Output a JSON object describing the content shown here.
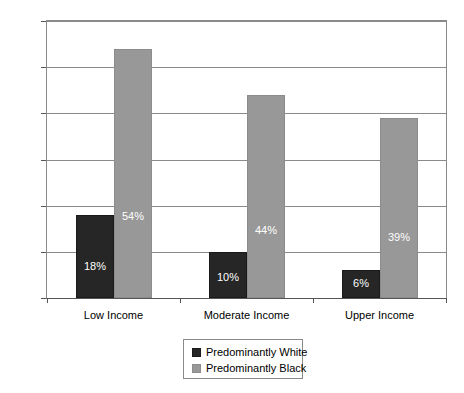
{
  "chart_data": {
    "type": "bar",
    "title": "",
    "subtitle": "",
    "xlabel": "",
    "ylabel": "",
    "categories": [
      "Low Income",
      "Moderate Income",
      "Upper Income"
    ],
    "series": [
      {
        "name": "Predominantly White",
        "color": "#262626",
        "values": [
          18,
          10,
          6
        ],
        "labels": [
          "18%",
          "10%",
          "6%"
        ]
      },
      {
        "name": "Predominantly Black",
        "color": "#989898",
        "values": [
          54,
          44,
          39
        ],
        "labels": [
          "54%",
          "44%",
          "39%"
        ]
      }
    ],
    "ylim": [
      0,
      60
    ],
    "yticks": [
      0,
      10,
      20,
      30,
      40,
      50,
      60
    ],
    "ytick_labels": [
      "0%",
      "10%",
      "20%",
      "30%",
      "40%",
      "50%",
      "60%"
    ],
    "grid": true,
    "grid_axis": "y",
    "legend_position": "bottom-center",
    "value_labels_inside_bars": true,
    "value_label_color": "#ffffff",
    "background_color": "#ffffff",
    "axis_color": "#8a8a8a"
  },
  "legend": {
    "entries": [
      {
        "label": "Predominantly White",
        "swatch": "white-series"
      },
      {
        "label": "Predominantly Black",
        "swatch": "black-series"
      }
    ]
  }
}
